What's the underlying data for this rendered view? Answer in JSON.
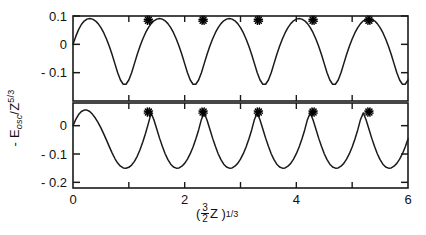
{
  "chart_data": {
    "type": "line",
    "title": "",
    "xlabel": "( 3/2 Z )^(1/3)",
    "ylabel": "- E_osc / Z^(5/3)",
    "xlim": [
      0,
      6
    ],
    "grid": false,
    "legend": "none",
    "x_ticks": [
      0,
      1,
      2,
      3,
      4,
      5,
      6
    ],
    "x_tick_labels": [
      "0",
      "",
      "2",
      "",
      "4",
      "",
      "6"
    ],
    "panels": [
      {
        "name": "upper-panel",
        "ylim": [
          -0.2,
          0.1
        ],
        "y_ticks": [
          0.1,
          0,
          -0.1
        ],
        "y_tick_labels": [
          "0.1",
          "0",
          "- 0.1"
        ],
        "series": [
          {
            "name": "oscillating-curve-upper",
            "comment": "damped-free periodic oscillation, period ~1 in x",
            "x": [
              0.0,
              0.05,
              0.1,
              0.15,
              0.2,
              0.25,
              0.3,
              0.35,
              0.4,
              0.45,
              0.5,
              0.55,
              0.6,
              0.65,
              0.7,
              0.75,
              0.8,
              0.85,
              0.9,
              0.95,
              1.0,
              1.05,
              1.1,
              1.15,
              1.2,
              1.25,
              1.3,
              1.35,
              1.4,
              1.45,
              1.5,
              1.55,
              1.6,
              1.65,
              1.7,
              1.75,
              1.8,
              1.85,
              1.9,
              1.95,
              2.0,
              2.05,
              2.1,
              2.15,
              2.2,
              2.25,
              2.3,
              2.35,
              2.4,
              2.45,
              2.5,
              2.55,
              2.6,
              2.65,
              2.7,
              2.75,
              2.8,
              2.85,
              2.9,
              2.95,
              3.0,
              3.05,
              3.1,
              3.15,
              3.2,
              3.25,
              3.3,
              3.35,
              3.4,
              3.45,
              3.5,
              3.55,
              3.6,
              3.65,
              3.7,
              3.75,
              3.8,
              3.85,
              3.9,
              3.95,
              4.0,
              4.05,
              4.1,
              4.15,
              4.2,
              4.25,
              4.3,
              4.35,
              4.4,
              4.45,
              4.5,
              4.55,
              4.6,
              4.65,
              4.7,
              4.75,
              4.8,
              4.85,
              4.9,
              4.95,
              5.0,
              5.05,
              5.1,
              5.15,
              5.2,
              5.25,
              5.3,
              5.35,
              5.4,
              5.45,
              5.5,
              5.55,
              5.6,
              5.65,
              5.7,
              5.75,
              5.8,
              5.85,
              5.9,
              5.95,
              6.0
            ],
            "y": [
              0.0,
              0.028,
              0.052,
              0.07,
              0.082,
              0.089,
              0.091,
              0.089,
              0.083,
              0.073,
              0.059,
              0.041,
              0.019,
              -0.007,
              -0.036,
              -0.068,
              -0.1,
              -0.126,
              -0.141,
              -0.141,
              -0.126,
              -0.1,
              -0.068,
              -0.036,
              -0.007,
              0.019,
              0.041,
              0.059,
              0.073,
              0.083,
              0.089,
              0.091,
              0.089,
              0.083,
              0.073,
              0.059,
              0.041,
              0.019,
              -0.007,
              -0.036,
              -0.068,
              -0.1,
              -0.126,
              -0.141,
              -0.141,
              -0.126,
              -0.1,
              -0.068,
              -0.036,
              -0.007,
              0.019,
              0.041,
              0.059,
              0.073,
              0.083,
              0.089,
              0.091,
              0.089,
              0.083,
              0.073,
              0.059,
              0.041,
              0.019,
              -0.007,
              -0.036,
              -0.068,
              -0.1,
              -0.126,
              -0.141,
              -0.141,
              -0.126,
              -0.1,
              -0.068,
              -0.036,
              -0.007,
              0.019,
              0.041,
              0.059,
              0.073,
              0.083,
              0.089,
              0.091,
              0.089,
              0.083,
              0.073,
              0.059,
              0.041,
              0.019,
              -0.007,
              -0.036,
              -0.068,
              -0.1,
              -0.126,
              -0.141,
              -0.141,
              -0.126,
              -0.1,
              -0.068,
              -0.036,
              -0.007,
              0.019,
              0.041,
              0.059,
              0.073,
              0.083,
              0.089,
              0.091,
              0.089,
              0.083,
              0.073,
              0.059,
              0.041,
              0.019,
              -0.007,
              -0.036,
              -0.068,
              -0.1,
              -0.126,
              -0.141,
              -0.141,
              -0.126
            ]
          }
        ],
        "markers": {
          "name": "asterisk-markers-upper",
          "symbol": "asterisk",
          "x": [
            1.35,
            2.33,
            3.32,
            4.3,
            5.3
          ],
          "y": [
            0.085,
            0.085,
            0.085,
            0.085,
            0.085
          ]
        }
      },
      {
        "name": "lower-panel",
        "ylim": [
          -0.22,
          0.08
        ],
        "y_ticks": [
          0,
          -0.1,
          -0.2
        ],
        "y_tick_labels": [
          "0",
          "- 0.1",
          "- 0.2"
        ],
        "series": [
          {
            "name": "oscillating-curve-lower",
            "comment": "sharper cusped peaks, deeper rounded minima, period ~1 in x",
            "x": [
              0.0,
              0.05,
              0.1,
              0.15,
              0.2,
              0.25,
              0.3,
              0.35,
              0.4,
              0.45,
              0.5,
              0.55,
              0.6,
              0.65,
              0.7,
              0.75,
              0.8,
              0.85,
              0.9,
              0.95,
              1.0,
              1.05,
              1.1,
              1.15,
              1.2,
              1.25,
              1.3,
              1.35,
              1.4,
              1.45,
              1.5,
              1.55,
              1.6,
              1.65,
              1.7,
              1.75,
              1.8,
              1.85,
              1.9,
              1.95,
              2.0,
              2.05,
              2.1,
              2.15,
              2.2,
              2.25,
              2.3,
              2.35,
              2.4,
              2.45,
              2.5,
              2.55,
              2.6,
              2.65,
              2.7,
              2.75,
              2.8,
              2.85,
              2.9,
              2.95,
              3.0,
              3.05,
              3.1,
              3.15,
              3.2,
              3.25,
              3.3,
              3.35,
              3.4,
              3.45,
              3.5,
              3.55,
              3.6,
              3.65,
              3.7,
              3.75,
              3.8,
              3.85,
              3.9,
              3.95,
              4.0,
              4.05,
              4.1,
              4.15,
              4.2,
              4.25,
              4.3,
              4.35,
              4.4,
              4.45,
              4.5,
              4.55,
              4.6,
              4.65,
              4.7,
              4.75,
              4.8,
              4.85,
              4.9,
              4.95,
              5.0,
              5.05,
              5.1,
              5.15,
              5.2,
              5.25,
              5.3,
              5.35,
              5.4,
              5.45,
              5.5,
              5.55,
              5.6,
              5.65,
              5.7,
              5.75,
              5.8,
              5.85,
              5.9,
              5.95,
              6.0
            ],
            "y": [
              0.0,
              0.022,
              0.039,
              0.05,
              0.055,
              0.055,
              0.05,
              0.04,
              0.027,
              0.011,
              -0.008,
              -0.029,
              -0.051,
              -0.074,
              -0.096,
              -0.116,
              -0.132,
              -0.143,
              -0.149,
              -0.15,
              -0.147,
              -0.139,
              -0.126,
              -0.108,
              -0.085,
              -0.058,
              -0.027,
              0.008,
              0.045,
              0.02,
              -0.012,
              -0.044,
              -0.073,
              -0.099,
              -0.12,
              -0.136,
              -0.146,
              -0.15,
              -0.149,
              -0.143,
              -0.133,
              -0.118,
              -0.099,
              -0.075,
              -0.047,
              -0.015,
              0.022,
              0.045,
              0.02,
              -0.012,
              -0.044,
              -0.073,
              -0.099,
              -0.12,
              -0.136,
              -0.146,
              -0.15,
              -0.149,
              -0.143,
              -0.133,
              -0.118,
              -0.099,
              -0.075,
              -0.047,
              -0.015,
              0.022,
              0.045,
              0.02,
              -0.012,
              -0.044,
              -0.073,
              -0.099,
              -0.12,
              -0.136,
              -0.146,
              -0.15,
              -0.149,
              -0.143,
              -0.133,
              -0.118,
              -0.099,
              -0.075,
              -0.047,
              -0.015,
              0.022,
              0.045,
              0.02,
              -0.012,
              -0.044,
              -0.073,
              -0.099,
              -0.12,
              -0.136,
              -0.146,
              -0.15,
              -0.149,
              -0.143,
              -0.133,
              -0.118,
              -0.099,
              -0.075,
              -0.047,
              -0.015,
              0.022,
              0.045,
              0.02,
              -0.012,
              -0.044,
              -0.073,
              -0.099,
              -0.12,
              -0.136,
              -0.146,
              -0.15,
              -0.149,
              -0.143,
              -0.133,
              -0.118,
              -0.099,
              -0.075,
              -0.047
            ]
          }
        ],
        "markers": {
          "name": "asterisk-markers-lower",
          "symbol": "asterisk",
          "x": [
            1.35,
            2.33,
            3.32,
            4.3,
            5.3
          ],
          "y": [
            0.048,
            0.048,
            0.048,
            0.048,
            0.048
          ]
        }
      }
    ],
    "style": {
      "line_color": "#1a1a1a",
      "axis_color": "#1a1a1a",
      "background": "#ffffff",
      "marker_color": "#000000"
    }
  },
  "axis_text": {
    "upper_y_labels": [
      "0.1",
      "0",
      "- 0.1"
    ],
    "lower_y_labels": [
      "0",
      "- 0.1",
      "- 0.2"
    ],
    "x_labels": [
      "0",
      "2",
      "4",
      "6"
    ],
    "y_axis_title_main": "- E",
    "y_axis_title_sub": "osc",
    "y_axis_title_div": "/Z",
    "y_axis_title_sup": "5/3",
    "x_axis_title_open": "(",
    "x_axis_title_num": "3",
    "x_axis_title_den": "2",
    "x_axis_title_var": "Z )",
    "x_axis_title_sup": "1/3"
  }
}
